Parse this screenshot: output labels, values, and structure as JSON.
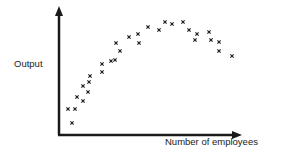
{
  "chart_data": {
    "type": "scatter",
    "title": "",
    "xlabel": "Number of employees",
    "ylabel": "Output",
    "grid": false,
    "legend": null,
    "axis_ticks": false,
    "marker": "x",
    "color": "#1a1a1a",
    "axes_px": {
      "origin_x": 59,
      "origin_y": 135,
      "y_top": 8,
      "x_right": 242
    },
    "points_px": [
      [
        72,
        123
      ],
      [
        68,
        109
      ],
      [
        75,
        109
      ],
      [
        77,
        97
      ],
      [
        83,
        101
      ],
      [
        83,
        86
      ],
      [
        88,
        92
      ],
      [
        89,
        82
      ],
      [
        90,
        76
      ],
      [
        102,
        72
      ],
      [
        102,
        64
      ],
      [
        111,
        61
      ],
      [
        115,
        60
      ],
      [
        116,
        43
      ],
      [
        120,
        51
      ],
      [
        129,
        37
      ],
      [
        138,
        34
      ],
      [
        139,
        43
      ],
      [
        148,
        27
      ],
      [
        159,
        30
      ],
      [
        165,
        22
      ],
      [
        172,
        24
      ],
      [
        183,
        22
      ],
      [
        189,
        30
      ],
      [
        197,
        34
      ],
      [
        195,
        40
      ],
      [
        209,
        32
      ],
      [
        211,
        40
      ],
      [
        219,
        42
      ],
      [
        219,
        51
      ],
      [
        232,
        56
      ]
    ],
    "points_relative": [
      [
        0.07,
        0.09
      ],
      [
        0.05,
        0.2
      ],
      [
        0.09,
        0.2
      ],
      [
        0.1,
        0.3
      ],
      [
        0.13,
        0.27
      ],
      [
        0.13,
        0.39
      ],
      [
        0.16,
        0.34
      ],
      [
        0.16,
        0.42
      ],
      [
        0.17,
        0.46
      ],
      [
        0.24,
        0.5
      ],
      [
        0.24,
        0.56
      ],
      [
        0.28,
        0.58
      ],
      [
        0.31,
        0.59
      ],
      [
        0.31,
        0.72
      ],
      [
        0.33,
        0.66
      ],
      [
        0.38,
        0.77
      ],
      [
        0.43,
        0.8
      ],
      [
        0.44,
        0.72
      ],
      [
        0.48,
        0.85
      ],
      [
        0.55,
        0.83
      ],
      [
        0.58,
        0.89
      ],
      [
        0.62,
        0.87
      ],
      [
        0.68,
        0.89
      ],
      [
        0.71,
        0.83
      ],
      [
        0.75,
        0.8
      ],
      [
        0.74,
        0.75
      ],
      [
        0.82,
        0.81
      ],
      [
        0.83,
        0.75
      ],
      [
        0.87,
        0.73
      ],
      [
        0.87,
        0.66
      ],
      [
        0.94,
        0.62
      ]
    ],
    "trend": "rises then falls (inverted U, diminishing returns)"
  }
}
